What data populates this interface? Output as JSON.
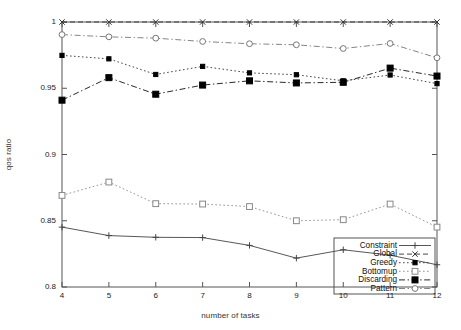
{
  "chart_data": {
    "type": "line",
    "title": "",
    "xlabel": "number of tasks",
    "ylabel": "qos ratio",
    "x": [
      4,
      5,
      6,
      7,
      8,
      9,
      10,
      11,
      12
    ],
    "xtick_labels": [
      "4",
      "5",
      "6",
      "7",
      "8",
      "9",
      "10",
      "11",
      "12"
    ],
    "ytick_labels": [
      "0.8",
      "0.85",
      "0.9",
      "0.95",
      "1"
    ],
    "ytick_values": [
      0.8,
      0.85,
      0.9,
      0.95,
      1.0
    ],
    "xlim": [
      4,
      12
    ],
    "ylim": [
      0.8,
      1.0
    ],
    "grid": false,
    "legend_position": "bottom-right",
    "series": [
      {
        "name": "Constraint",
        "marker": "plus",
        "dash": "solid",
        "color": "#444444",
        "values": [
          0.8452,
          0.8388,
          0.8375,
          0.8373,
          0.8314,
          0.8218,
          0.8281,
          0.824,
          0.8168
        ]
      },
      {
        "name": "Global",
        "marker": "cross",
        "dash": "dashed",
        "color": "#333333",
        "values": [
          1.0,
          1.0,
          1.0,
          1.0,
          1.0,
          1.0,
          1.0,
          1.0,
          1.0
        ]
      },
      {
        "name": "Greedy",
        "marker": "filled-square-small",
        "dash": "dotted",
        "color": "#333333",
        "values": [
          0.9748,
          0.9722,
          0.9604,
          0.9665,
          0.9616,
          0.9602,
          0.9556,
          0.96,
          0.9535
        ]
      },
      {
        "name": "Bottomup",
        "marker": "open-square",
        "dash": "dotted",
        "color": "#888888",
        "values": [
          0.8691,
          0.8792,
          0.8629,
          0.8626,
          0.8607,
          0.85,
          0.8508,
          0.8626,
          0.8452
        ]
      },
      {
        "name": "Discarding",
        "marker": "filled-square",
        "dash": "dash-dot",
        "color": "#111111",
        "values": [
          0.941,
          0.958,
          0.9455,
          0.9524,
          0.9556,
          0.954,
          0.9545,
          0.9652,
          0.9592
        ]
      },
      {
        "name": "Pattern",
        "marker": "open-circle",
        "dash": "dash-dot",
        "color": "#777777",
        "values": [
          0.9905,
          0.9888,
          0.9878,
          0.9853,
          0.9836,
          0.9828,
          0.98,
          0.9838,
          0.973
        ]
      }
    ]
  },
  "legend": {
    "items": [
      {
        "label": "Constraint"
      },
      {
        "label": "Global"
      },
      {
        "label": "Greedy"
      },
      {
        "label": "Bottomup"
      },
      {
        "label": "Discarding"
      },
      {
        "label": "Pattern"
      }
    ]
  }
}
